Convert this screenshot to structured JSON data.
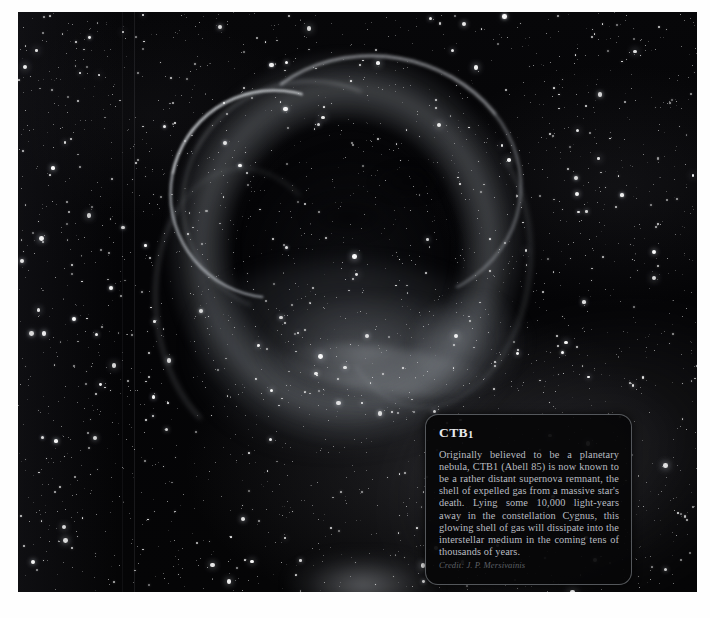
{
  "page": {
    "background_color": "#ffffff"
  },
  "plate": {
    "name": "ctb1-supernova-remnant-photograph",
    "background_color": "#050507",
    "subject": "CTB1 supernova remnant star field"
  },
  "caption": {
    "title": "CTB",
    "title_number": "1",
    "body": "Originally believed to be a planetary nebula, CTB1 (Abell 85) is now known to be a rather distant supernova remnant, the shell of expelled gas from a massive star's death. Lying some 10,000 light-years away in the constellation Cygnus, this glowing shell of gas will dissipate into the interstellar medium in the coming tens of thousands of years.",
    "credit": "Credit: J. P. Mersivainis",
    "background_color": "#060608",
    "border_color": "#969aa0",
    "text_color": "#b9bcc1"
  }
}
